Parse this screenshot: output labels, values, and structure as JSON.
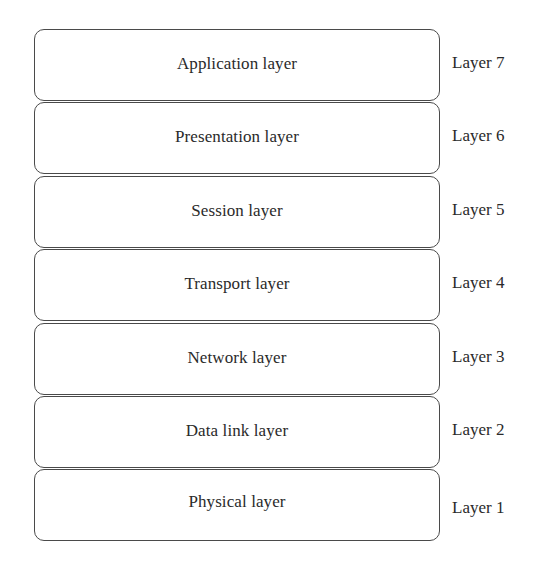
{
  "diagram": {
    "title": "",
    "layers": [
      {
        "name": "Application  layer",
        "number": "Layer 7"
      },
      {
        "name": "Presentation layer",
        "number": "Layer 6"
      },
      {
        "name": "Session layer",
        "number": "Layer 5"
      },
      {
        "name": "Transport layer",
        "number": "Layer 4"
      },
      {
        "name": "Network layer",
        "number": "Layer 3"
      },
      {
        "name": "Data link layer",
        "number": "Layer 2"
      },
      {
        "name": "Physical layer",
        "number": "Layer 1"
      }
    ],
    "colors": {
      "border": "#4a4a4a",
      "text": "#2a2a2a",
      "background": "#ffffff"
    }
  }
}
